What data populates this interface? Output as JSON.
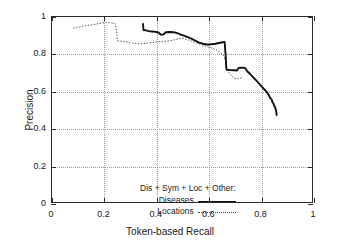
{
  "chart_data": {
    "type": "line",
    "title": "",
    "xlabel": "Token-based Recall",
    "ylabel": "Precision",
    "xlim": [
      0,
      1
    ],
    "ylim": [
      0,
      1
    ],
    "grid": true,
    "xticks": [
      "0",
      "0.2",
      "0.4",
      "0.6",
      "0.8",
      "1"
    ],
    "xtick_values": [
      0,
      0.2,
      0.4,
      0.6,
      0.8,
      1
    ],
    "yticks": [
      "0",
      "0.2",
      "0.4",
      "0.6",
      "0.8",
      "1"
    ],
    "ytick_values": [
      0,
      0.2,
      0.4,
      0.6,
      0.8,
      1
    ],
    "legend_position": "inside lower-center",
    "legend_title": "Dis + Sym + Loc + Other:",
    "series": [
      {
        "name": "Diseases",
        "style": "solid",
        "color": "#111111",
        "points": [
          [
            0.35,
            0.962
          ],
          [
            0.352,
            0.93
          ],
          [
            0.362,
            0.928
          ],
          [
            0.372,
            0.924
          ],
          [
            0.385,
            0.922
          ],
          [
            0.398,
            0.92
          ],
          [
            0.408,
            0.918
          ],
          [
            0.418,
            0.906
          ],
          [
            0.428,
            0.905
          ],
          [
            0.438,
            0.918
          ],
          [
            0.452,
            0.919
          ],
          [
            0.468,
            0.918
          ],
          [
            0.482,
            0.913
          ],
          [
            0.496,
            0.905
          ],
          [
            0.51,
            0.898
          ],
          [
            0.524,
            0.89
          ],
          [
            0.538,
            0.882
          ],
          [
            0.552,
            0.872
          ],
          [
            0.566,
            0.862
          ],
          [
            0.58,
            0.856
          ],
          [
            0.596,
            0.852
          ],
          [
            0.612,
            0.853
          ],
          [
            0.628,
            0.856
          ],
          [
            0.642,
            0.86
          ],
          [
            0.656,
            0.864
          ],
          [
            0.664,
            0.866
          ],
          [
            0.668,
            0.79
          ],
          [
            0.67,
            0.73
          ],
          [
            0.672,
            0.716
          ],
          [
            0.686,
            0.714
          ],
          [
            0.7,
            0.713
          ],
          [
            0.712,
            0.712
          ],
          [
            0.718,
            0.726
          ],
          [
            0.73,
            0.727
          ],
          [
            0.742,
            0.726
          ],
          [
            0.752,
            0.706
          ],
          [
            0.764,
            0.69
          ],
          [
            0.776,
            0.672
          ],
          [
            0.788,
            0.654
          ],
          [
            0.8,
            0.636
          ],
          [
            0.81,
            0.62
          ],
          [
            0.818,
            0.608
          ],
          [
            0.826,
            0.596
          ],
          [
            0.834,
            0.578
          ],
          [
            0.84,
            0.562
          ],
          [
            0.845,
            0.556
          ],
          [
            0.848,
            0.54
          ],
          [
            0.852,
            0.534
          ],
          [
            0.855,
            0.52
          ],
          [
            0.858,
            0.516
          ],
          [
            0.86,
            0.502
          ],
          [
            0.862,
            0.498
          ],
          [
            0.863,
            0.484
          ],
          [
            0.864,
            0.472
          ]
        ]
      },
      {
        "name": "Locations",
        "style": "dotted",
        "color": "#4a4a4a",
        "points": [
          [
            0.082,
            0.94
          ],
          [
            0.094,
            0.944
          ],
          [
            0.106,
            0.946
          ],
          [
            0.118,
            0.95
          ],
          [
            0.13,
            0.953
          ],
          [
            0.142,
            0.956
          ],
          [
            0.154,
            0.958
          ],
          [
            0.166,
            0.961
          ],
          [
            0.178,
            0.964
          ],
          [
            0.19,
            0.967
          ],
          [
            0.2,
            0.969
          ],
          [
            0.21,
            0.971
          ],
          [
            0.22,
            0.97
          ],
          [
            0.23,
            0.968
          ],
          [
            0.238,
            0.966
          ],
          [
            0.244,
            0.962
          ],
          [
            0.248,
            0.93
          ],
          [
            0.25,
            0.9
          ],
          [
            0.252,
            0.872
          ],
          [
            0.262,
            0.87
          ],
          [
            0.274,
            0.868
          ],
          [
            0.286,
            0.866
          ],
          [
            0.298,
            0.864
          ],
          [
            0.31,
            0.86
          ],
          [
            0.322,
            0.857
          ],
          [
            0.334,
            0.855
          ],
          [
            0.346,
            0.856
          ],
          [
            0.358,
            0.858
          ],
          [
            0.37,
            0.86
          ],
          [
            0.382,
            0.862
          ],
          [
            0.394,
            0.864
          ],
          [
            0.406,
            0.866
          ],
          [
            0.418,
            0.866
          ],
          [
            0.43,
            0.868
          ],
          [
            0.442,
            0.87
          ],
          [
            0.454,
            0.872
          ],
          [
            0.466,
            0.876
          ],
          [
            0.478,
            0.88
          ],
          [
            0.49,
            0.884
          ],
          [
            0.5,
            0.886
          ],
          [
            0.512,
            0.882
          ],
          [
            0.524,
            0.876
          ],
          [
            0.536,
            0.87
          ],
          [
            0.548,
            0.864
          ],
          [
            0.56,
            0.858
          ],
          [
            0.572,
            0.852
          ],
          [
            0.584,
            0.846
          ],
          [
            0.596,
            0.84
          ],
          [
            0.608,
            0.836
          ],
          [
            0.62,
            0.83
          ],
          [
            0.632,
            0.822
          ],
          [
            0.644,
            0.812
          ],
          [
            0.654,
            0.8
          ],
          [
            0.662,
            0.786
          ],
          [
            0.668,
            0.76
          ],
          [
            0.672,
            0.73
          ],
          [
            0.678,
            0.706
          ],
          [
            0.686,
            0.69
          ],
          [
            0.694,
            0.678
          ],
          [
            0.702,
            0.67
          ],
          [
            0.71,
            0.666
          ],
          [
            0.718,
            0.668
          ],
          [
            0.726,
            0.67
          ],
          [
            0.732,
            0.672
          ]
        ]
      }
    ]
  }
}
